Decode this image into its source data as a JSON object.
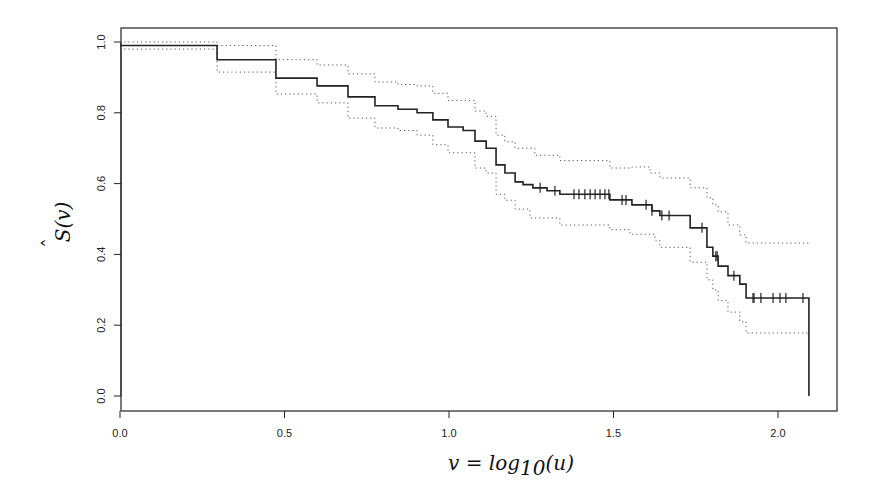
{
  "chart_data": {
    "type": "line",
    "subtype": "kaplan-meier step function with confidence bands",
    "title": "",
    "xlabel": "v = log10(u)",
    "ylabel": "Ŝ(v)",
    "xlim": [
      0.0,
      2.2
    ],
    "ylim": [
      0.0,
      1.0
    ],
    "x_ticks": [
      0.0,
      0.5,
      1.0,
      1.5,
      2.0
    ],
    "x_tick_labels": [
      "0.0",
      "0.5",
      "1.0",
      "1.5",
      "2.0"
    ],
    "y_ticks": [
      0.0,
      0.2,
      0.4,
      0.6,
      0.8,
      1.0
    ],
    "y_tick_labels": [
      "0.0",
      "0.2",
      "0.4",
      "0.6",
      "0.8",
      "1.0"
    ],
    "grid": false,
    "legend": null,
    "series": [
      {
        "name": "Survival estimate",
        "style": "solid",
        "steps": [
          [
            0.0,
            0.99
          ],
          [
            0.295,
            0.95
          ],
          [
            0.474,
            0.898
          ],
          [
            0.599,
            0.876
          ],
          [
            0.693,
            0.845
          ],
          [
            0.775,
            0.82
          ],
          [
            0.845,
            0.81
          ],
          [
            0.903,
            0.8
          ],
          [
            0.951,
            0.78
          ],
          [
            0.997,
            0.76
          ],
          [
            1.043,
            0.75
          ],
          [
            1.079,
            0.72
          ],
          [
            1.113,
            0.7
          ],
          [
            1.143,
            0.653
          ],
          [
            1.17,
            0.63
          ],
          [
            1.201,
            0.605
          ],
          [
            1.225,
            0.597
          ],
          [
            1.255,
            0.588
          ],
          [
            1.298,
            0.58
          ],
          [
            1.337,
            0.57
          ],
          [
            1.489,
            0.554
          ],
          [
            1.556,
            0.54
          ],
          [
            1.617,
            0.523
          ],
          [
            1.641,
            0.51
          ],
          [
            1.733,
            0.475
          ],
          [
            1.784,
            0.42
          ],
          [
            1.802,
            0.395
          ],
          [
            1.818,
            0.367
          ],
          [
            1.848,
            0.34
          ],
          [
            1.884,
            0.316
          ],
          [
            1.903,
            0.277
          ],
          [
            2.094,
            0.0
          ]
        ],
        "censor_marks_v": [
          1.277,
          1.322,
          1.38,
          1.395,
          1.413,
          1.429,
          1.444,
          1.459,
          1.474,
          1.486,
          1.526,
          1.538,
          1.599,
          1.617,
          1.647,
          1.669,
          1.769,
          1.811,
          1.815,
          1.866,
          1.924,
          1.927,
          1.948,
          1.985,
          2.006,
          2.024,
          2.076
        ]
      },
      {
        "name": "Upper confidence band",
        "style": "dotted",
        "steps": [
          [
            0.0,
            1.0
          ],
          [
            0.295,
            0.99
          ],
          [
            0.474,
            0.95
          ],
          [
            0.599,
            0.935
          ],
          [
            0.693,
            0.91
          ],
          [
            0.775,
            0.887
          ],
          [
            0.845,
            0.88
          ],
          [
            0.903,
            0.876
          ],
          [
            0.951,
            0.855
          ],
          [
            0.997,
            0.835
          ],
          [
            1.079,
            0.805
          ],
          [
            1.113,
            0.79
          ],
          [
            1.143,
            0.737
          ],
          [
            1.17,
            0.718
          ],
          [
            1.201,
            0.7
          ],
          [
            1.261,
            0.68
          ],
          [
            1.337,
            0.665
          ],
          [
            1.489,
            0.644
          ],
          [
            1.556,
            0.647
          ],
          [
            1.611,
            0.63
          ],
          [
            1.641,
            0.616
          ],
          [
            1.733,
            0.588
          ],
          [
            1.784,
            0.56
          ],
          [
            1.802,
            0.54
          ],
          [
            1.818,
            0.52
          ],
          [
            1.848,
            0.483
          ],
          [
            1.884,
            0.455
          ],
          [
            1.903,
            0.432
          ],
          [
            2.094,
            0.432
          ]
        ]
      },
      {
        "name": "Lower confidence band",
        "style": "dotted",
        "steps": [
          [
            0.0,
            0.98
          ],
          [
            0.295,
            0.915
          ],
          [
            0.474,
            0.853
          ],
          [
            0.599,
            0.828
          ],
          [
            0.693,
            0.785
          ],
          [
            0.775,
            0.757
          ],
          [
            0.845,
            0.75
          ],
          [
            0.903,
            0.737
          ],
          [
            0.951,
            0.71
          ],
          [
            0.997,
            0.687
          ],
          [
            1.079,
            0.644
          ],
          [
            1.113,
            0.63
          ],
          [
            1.143,
            0.57
          ],
          [
            1.17,
            0.553
          ],
          [
            1.201,
            0.528
          ],
          [
            1.246,
            0.503
          ],
          [
            1.337,
            0.483
          ],
          [
            1.489,
            0.47
          ],
          [
            1.55,
            0.457
          ],
          [
            1.626,
            0.44
          ],
          [
            1.641,
            0.42
          ],
          [
            1.733,
            0.378
          ],
          [
            1.784,
            0.328
          ],
          [
            1.802,
            0.3
          ],
          [
            1.818,
            0.27
          ],
          [
            1.848,
            0.237
          ],
          [
            1.884,
            0.21
          ],
          [
            1.903,
            0.178
          ],
          [
            2.094,
            0.178
          ]
        ]
      }
    ]
  },
  "labels": {
    "x_axis_title_lhs": "v",
    "x_axis_title_eq": " = log",
    "x_axis_title_sub": "10",
    "x_axis_title_arg": "(u)",
    "y_axis_title_main": "S",
    "y_axis_title_hat": "ˆ",
    "y_axis_title_arg": "(v)"
  },
  "colors": {
    "line": "#222222",
    "band": "#555555",
    "frame": "#222222"
  }
}
